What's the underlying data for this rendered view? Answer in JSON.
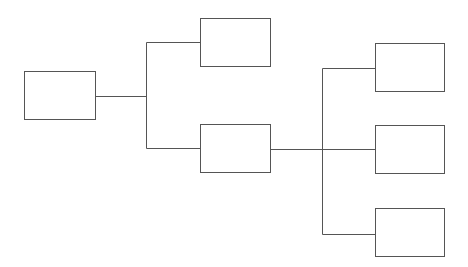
{
  "diagram": {
    "type": "tree",
    "stroke_color": "#555555",
    "background": "#ffffff",
    "nodes": [
      {
        "id": "root",
        "label": "",
        "x": 24,
        "y": 71,
        "w": 71,
        "h": 48
      },
      {
        "id": "child-1",
        "label": "",
        "x": 200,
        "y": 18,
        "w": 70,
        "h": 48
      },
      {
        "id": "child-2",
        "label": "",
        "x": 200,
        "y": 124,
        "w": 70,
        "h": 48
      },
      {
        "id": "grandchild-1",
        "label": "",
        "x": 375,
        "y": 43,
        "w": 69,
        "h": 48
      },
      {
        "id": "grandchild-2",
        "label": "",
        "x": 375,
        "y": 125,
        "w": 69,
        "h": 48
      },
      {
        "id": "grandchild-3",
        "label": "",
        "x": 375,
        "y": 208,
        "w": 69,
        "h": 48
      }
    ],
    "edges": [
      {
        "from": "root",
        "to": "child-1"
      },
      {
        "from": "root",
        "to": "child-2"
      },
      {
        "from": "child-2",
        "to": "grandchild-1"
      },
      {
        "from": "child-2",
        "to": "grandchild-2"
      },
      {
        "from": "child-2",
        "to": "grandchild-3"
      }
    ]
  }
}
